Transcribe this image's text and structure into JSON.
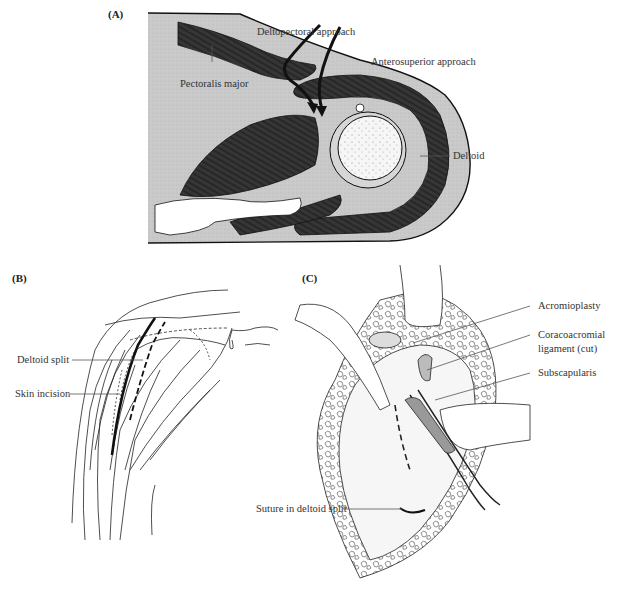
{
  "figure": {
    "panels": [
      {
        "id": "A",
        "label": "(A)",
        "description": "Cross-section of shoulder showing surgical approaches",
        "annotations": {
          "deltopectoral": "Deltopectoral approach",
          "anterosuperior": "Anterosuperior approach",
          "pectoralis": "Pectoralis major",
          "deltoid": "Deltoid"
        }
      },
      {
        "id": "B",
        "label": "(B)",
        "description": "Lateral view of shoulder showing deltoid muscle fibers and incision",
        "annotations": {
          "deltoid_split": "Deltoid split",
          "skin_incision": "Skin incision"
        }
      },
      {
        "id": "C",
        "label": "(C)",
        "description": "Operative view of anterosuperior exposure",
        "annotations": {
          "acromioplasty": "Acromioplasty",
          "coracoacromial_1": "Coracoacromial",
          "coracoacromial_2": "ligament (cut)",
          "subscapularis": "Subscapularis",
          "suture": "Suture in deltoid split"
        }
      }
    ],
    "colors": {
      "muscle": "#2e2e2e",
      "tissue": "#c8c8c8",
      "bone": "#f4f4f4",
      "line": "#222222"
    }
  }
}
